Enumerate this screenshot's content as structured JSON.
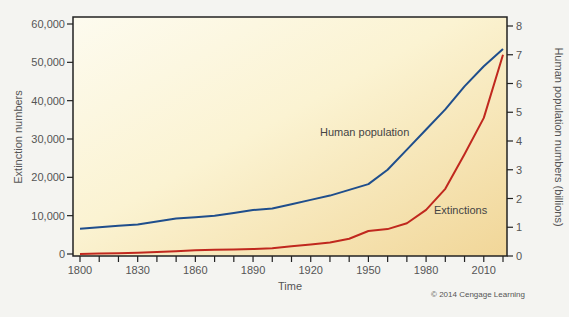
{
  "chart_data": {
    "type": "line",
    "title": "",
    "xlabel": "Time",
    "ylabel": "Extinction numbers",
    "y2label": "Human population numbers (billions)",
    "x": [
      1800,
      1810,
      1820,
      1830,
      1840,
      1850,
      1860,
      1870,
      1880,
      1890,
      1900,
      1910,
      1920,
      1930,
      1940,
      1950,
      1960,
      1970,
      1980,
      1990,
      2000,
      2010,
      2020
    ],
    "x_tick_labels": [
      "1800",
      "1830",
      "1860",
      "1890",
      "1920",
      "1950",
      "1980",
      "2010"
    ],
    "xlim": [
      1800,
      2020
    ],
    "ylim": [
      0,
      60000
    ],
    "y_tick_labels": [
      "0",
      "10,000",
      "20,000",
      "30,000",
      "40,000",
      "50,000",
      "60,000"
    ],
    "y2lim": [
      0,
      8
    ],
    "y2_tick_labels": [
      "0",
      "1",
      "2",
      "3",
      "4",
      "5",
      "6",
      "7",
      "8"
    ],
    "series": [
      {
        "name": "Human population",
        "axis": "right",
        "color": "#1f4e8c",
        "values": [
          0.95,
          1.0,
          1.05,
          1.1,
          1.2,
          1.3,
          1.35,
          1.4,
          1.5,
          1.6,
          1.65,
          1.8,
          1.95,
          2.1,
          2.3,
          2.5,
          3.0,
          3.7,
          4.4,
          5.1,
          5.9,
          6.6,
          7.2
        ]
      },
      {
        "name": "Extinctions",
        "axis": "left",
        "color": "#c0281e",
        "values": [
          0,
          100,
          200,
          300,
          500,
          700,
          1000,
          1100,
          1200,
          1300,
          1500,
          2000,
          2500,
          3000,
          4000,
          6000,
          6500,
          8000,
          11500,
          17000,
          26000,
          35500,
          52000
        ]
      }
    ],
    "annotations": [
      "Human population",
      "Extinctions"
    ],
    "grid": false,
    "legend": "inline labels"
  },
  "credit": "© 2014 Cengage Learning",
  "colors": {
    "plot_bg_left": "#fbf8e2",
    "plot_bg_right": "#f3dc9e",
    "population": "#1f4e8c",
    "extinctions": "#c0281e",
    "axis": "#222222"
  }
}
